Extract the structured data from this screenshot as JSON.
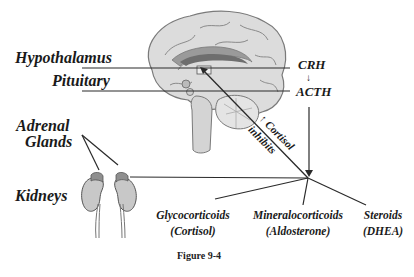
{
  "figure": {
    "caption": "Figure 9-4",
    "labels": {
      "hypothalamus": "Hypothalamus",
      "pituitary": "Pituitary",
      "adrenal_line1": "Adrenal",
      "adrenal_line2": "Glands",
      "kidneys": "Kidneys"
    },
    "hormones": {
      "crh": "CRH",
      "acth": "ACTH",
      "crh_to_acth_arrow": "↓"
    },
    "feedback": {
      "line1": "↑ Cortisol",
      "line2": "inhibits"
    },
    "outputs": [
      {
        "name": "Glycocorticoids",
        "example": "(Cortisol)"
      },
      {
        "name": "Mineralocorticoids",
        "example": "(Aldosterone)"
      },
      {
        "name": "Steroids",
        "example": "(DHEA)"
      }
    ],
    "colors": {
      "line": "#2a2a2a",
      "brain_fill": "#d9d9d9",
      "brain_stroke": "#7a7a7a",
      "kidney_fill": "#c8c8c8",
      "adrenal_fill": "#8f8f8f"
    }
  }
}
